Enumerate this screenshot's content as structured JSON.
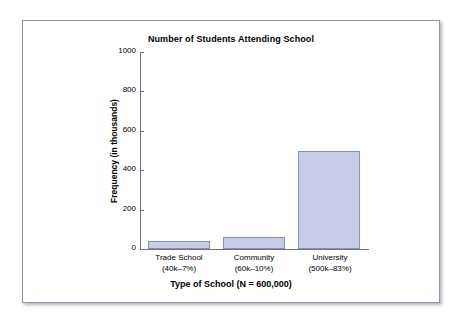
{
  "chart_data": {
    "type": "bar",
    "title": "Number of Students Attending School",
    "xlabel": "Type of School (N = 600,000)",
    "ylabel": "Frequency (in thousands)",
    "categories": [
      "Trade School",
      "Community",
      "University"
    ],
    "category_sublabels": [
      "(40k–7%)",
      "(60k–10%)",
      "(500k–83%)"
    ],
    "values": [
      40,
      60,
      500
    ],
    "ylim": [
      0,
      1000
    ],
    "yticks": [
      0,
      200,
      400,
      600,
      800,
      1000
    ],
    "ytick_labels": [
      "0",
      "200",
      "400",
      "600",
      "800",
      "1000"
    ],
    "grid": false,
    "legend": "none",
    "bar_fill_color": "#c6cce5",
    "bar_border_color": "#8a90b4",
    "axis_color": "#6f7180",
    "frame_border_color": "#9195a8",
    "background_color": "#ffffff"
  }
}
